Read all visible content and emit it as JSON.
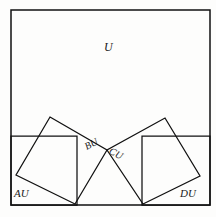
{
  "figure": {
    "background_color": "#fdfdfc",
    "stroke_color": "#111111",
    "width": 216,
    "height": 217
  },
  "labels": {
    "universe": "U",
    "left_region": "AU",
    "right_region": "DU",
    "left_quad": "BU",
    "right_quad": "CU"
  },
  "shapes": {
    "universe_rect": {
      "name": "universe-rectangle",
      "points": "11,10 210,10 210,205 11,205"
    },
    "left_rect": {
      "name": "left-subrectangle",
      "points": "11,136 77,136 77,205 11,205"
    },
    "right_rect": {
      "name": "right-subrectangle",
      "points": "142,136 210,136 210,205 142,205"
    },
    "left_quad": {
      "name": "left-rotated-quadrilateral",
      "points": "50,117 107,150 75,204 16,175"
    },
    "right_quad": {
      "name": "right-rotated-quadrilateral",
      "points": "165,118 200,176 143,204 107,150"
    },
    "divider_line": {
      "name": "horizontal-divider",
      "x1": 11,
      "y1": 136,
      "x2": 210,
      "y2": 136
    }
  },
  "chart_data": {
    "type": "diagram",
    "regions": [
      {
        "label": "U",
        "shape": "rectangle",
        "role": "universe"
      },
      {
        "label": "AU",
        "shape": "rectangle",
        "role": "bottom-left-subregion"
      },
      {
        "label": "DU",
        "shape": "rectangle",
        "role": "bottom-right-subregion"
      },
      {
        "label": "BU",
        "shape": "quadrilateral",
        "role": "left-tilted-region"
      },
      {
        "label": "CU",
        "shape": "quadrilateral",
        "role": "right-tilted-region"
      }
    ],
    "shared_vertex": [
      107,
      150
    ]
  }
}
